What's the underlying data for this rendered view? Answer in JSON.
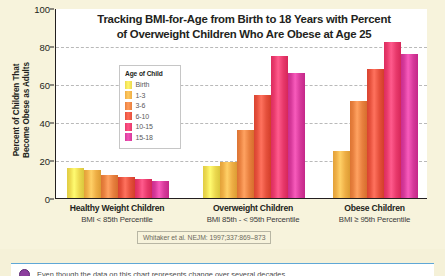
{
  "chart_data": {
    "type": "bar",
    "title_line1": "Tracking BMI-for-Age from Birth to 18 Years with Percent",
    "title_line2": "of Overweight Children Who Are Obese at Age 25",
    "xlabel": "",
    "ylabel": "Percent of Children That Become Obese as Adults",
    "ylabel_line1": "Percent of Children That",
    "ylabel_line2": "Become Obese as Adults",
    "ylim": [
      0,
      100
    ],
    "yticks": [
      100,
      80,
      60,
      40,
      20,
      0
    ],
    "grid": "horizontal-dashed",
    "legend_position": "inside-upper-left",
    "legend_title": "Age of Child",
    "categories": [
      "Healthy Weight Children",
      "Overweight Children",
      "Obese Children"
    ],
    "category_sublabels": [
      "BMI < 85th Percentile",
      "BMI 85th - < 95th Percentile",
      "BMI ≥ 95th Percentile"
    ],
    "series": [
      {
        "name": "Birth",
        "color": "#ecd94f",
        "values": [
          16,
          17,
          null
        ]
      },
      {
        "name": "1-3",
        "color": "#eeae45",
        "values": [
          15,
          19,
          25
        ]
      },
      {
        "name": "3-6",
        "color": "#e8803f",
        "values": [
          12,
          36,
          51
        ]
      },
      {
        "name": "6-10",
        "color": "#e5503c",
        "values": [
          11,
          54,
          68
        ]
      },
      {
        "name": "10-15",
        "color": "#e8396b",
        "values": [
          10,
          75,
          82
        ]
      },
      {
        "name": "15-18",
        "color": "#d6399a",
        "values": [
          9,
          66,
          76
        ]
      }
    ],
    "annotations": [
      "Whitaker et al. NEJM: 1997;337:869-873"
    ]
  },
  "figure": {
    "background_color": "#f7f3dc",
    "plot_background_color": "#ffffff",
    "citation": "Whitaker et al. NEJM: 1997;337:869–873"
  },
  "callout": {
    "icon": "purple-bullet-icon",
    "text": "Even though the data on this chart represents change over several decades,"
  }
}
